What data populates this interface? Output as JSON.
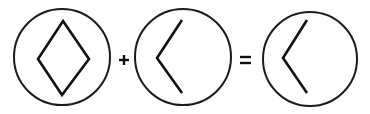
{
  "figure": {
    "colors": {
      "stroke": "#111111",
      "background": "#ffffff"
    },
    "terms": [
      {
        "id": "term-1",
        "icon": "diamond-icon",
        "label": "diamond",
        "circle": {
          "cx": 62,
          "cy": 57,
          "r": 48
        }
      },
      {
        "id": "term-2",
        "icon": "left-chevron-icon",
        "label": "left chevron",
        "circle": {
          "cx": 183,
          "cy": 57,
          "r": 48
        }
      },
      {
        "id": "result",
        "icon": "left-chevron-icon",
        "label": "left chevron",
        "circle": {
          "cx": 310,
          "cy": 59,
          "r": 47
        }
      }
    ],
    "operators": [
      {
        "symbol": "+",
        "name": "plus"
      },
      {
        "symbol": "=",
        "name": "equals"
      }
    ]
  }
}
